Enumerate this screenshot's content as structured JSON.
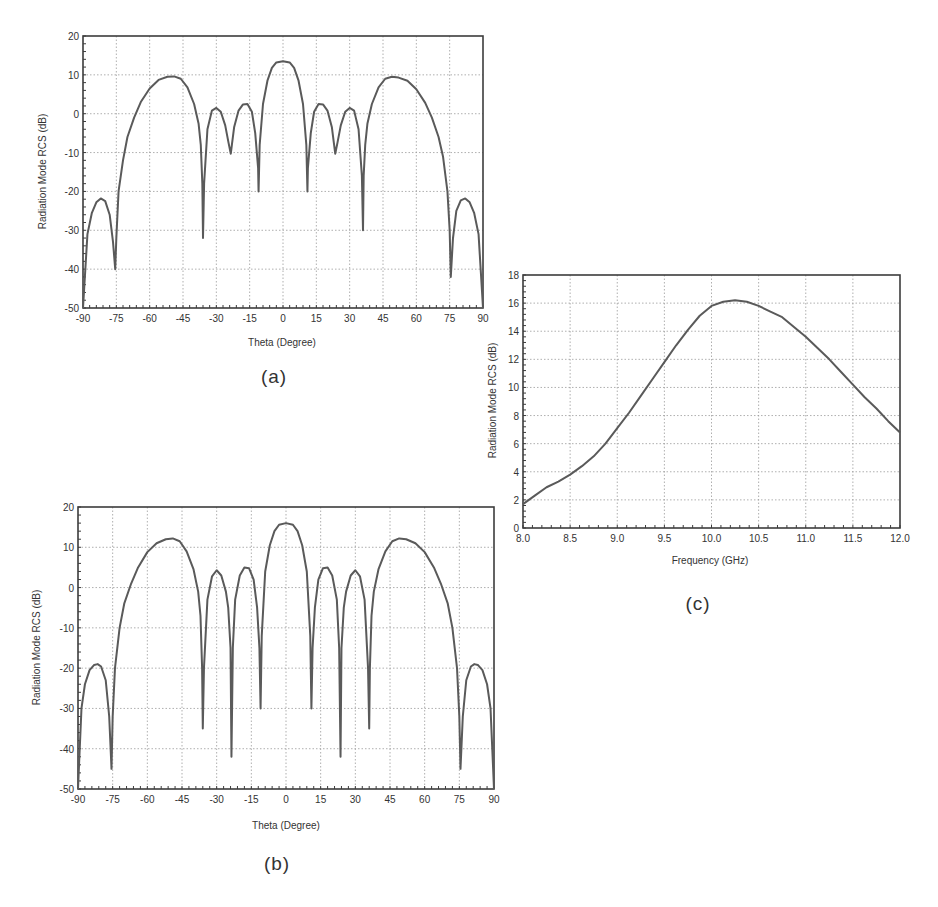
{
  "chart_data": [
    {
      "id": "a",
      "type": "line",
      "caption": "(a)",
      "title": "",
      "xlabel": "Theta (Degree)",
      "ylabel": "Radiation Mode RCS (dB)",
      "xlim": [
        -90,
        90
      ],
      "ylim": [
        -50,
        20
      ],
      "xticks": [
        -90,
        -75,
        -60,
        -45,
        -30,
        -15,
        0,
        15,
        30,
        45,
        60,
        75,
        90
      ],
      "yticks": [
        -50,
        -40,
        -30,
        -20,
        -10,
        0,
        10,
        20
      ],
      "grid": true,
      "legend": null,
      "series": [
        {
          "name": "Radiation mode RCS",
          "x": [
            -90,
            -88,
            -86,
            -84,
            -82,
            -80,
            -78,
            -76.5,
            -75.5,
            -75,
            -74,
            -72,
            -70,
            -67,
            -64,
            -60,
            -56,
            -52,
            -49,
            -46,
            -43,
            -40,
            -38,
            -37,
            -36.3,
            -36,
            -35.5,
            -34,
            -32,
            -30,
            -28,
            -26,
            -24.5,
            -23.5,
            -23,
            -22,
            -20,
            -18,
            -16,
            -14,
            -12.5,
            -11.2,
            -11,
            -10.5,
            -9,
            -7,
            -5,
            -3,
            0,
            3,
            5,
            7,
            9,
            10.5,
            11,
            11.2,
            12.5,
            14,
            16,
            18,
            20,
            22,
            23,
            23.5,
            24.5,
            26,
            28,
            30,
            32,
            34,
            35.5,
            36,
            36.3,
            37,
            38,
            40,
            43,
            46,
            49,
            52,
            56,
            60,
            64,
            67,
            70,
            72,
            74,
            75,
            75.5,
            76.5,
            78,
            80,
            82,
            84,
            86,
            88,
            90
          ],
          "y": [
            -50,
            -31,
            -25.5,
            -22.8,
            -21.8,
            -22.5,
            -26,
            -33,
            -40,
            -32,
            -20,
            -12,
            -6,
            -1,
            3,
            6.5,
            8.7,
            9.5,
            9.6,
            9,
            6.8,
            2.5,
            -2.5,
            -8,
            -18,
            -32,
            -18,
            -4,
            0.8,
            1.5,
            0.5,
            -3,
            -7.5,
            -10.3,
            -8,
            -3.5,
            0.8,
            2.4,
            2.5,
            0.5,
            -5,
            -14,
            -20,
            -8,
            2.5,
            8.5,
            11.8,
            13.2,
            13.5,
            13.2,
            11.8,
            8.5,
            2.5,
            -8,
            -20,
            -14,
            -5,
            0.5,
            2.5,
            2.4,
            0.8,
            -3.5,
            -8,
            -10.3,
            -7.5,
            -3,
            0.5,
            1.5,
            0.8,
            -4,
            -16,
            -30,
            -16,
            -8,
            -2.5,
            2.5,
            6.8,
            9,
            9.5,
            9.3,
            8.5,
            6.3,
            2.8,
            -1,
            -6,
            -11,
            -20,
            -30,
            -42,
            -32,
            -25,
            -22.3,
            -21.8,
            -22.8,
            -25.5,
            -31,
            -50
          ]
        }
      ]
    },
    {
      "id": "b",
      "type": "line",
      "caption": "(b)",
      "title": "",
      "xlabel": "Theta (Degree)",
      "ylabel": "Radiation Mode RCS (dB)",
      "xlim": [
        -90,
        90
      ],
      "ylim": [
        -50,
        20
      ],
      "xticks": [
        -90,
        -75,
        -60,
        -45,
        -30,
        -15,
        0,
        15,
        30,
        45,
        60,
        75,
        90
      ],
      "yticks": [
        -50,
        -40,
        -30,
        -20,
        -10,
        0,
        10,
        20
      ],
      "grid": true,
      "legend": null,
      "series": [
        {
          "name": "Radiation mode RCS",
          "x": [
            -90,
            -88.5,
            -87,
            -85,
            -83,
            -81.5,
            -80,
            -78,
            -76.5,
            -75.5,
            -75,
            -74,
            -72,
            -70,
            -67,
            -64,
            -60,
            -56,
            -52,
            -49,
            -46,
            -43,
            -40,
            -38,
            -37,
            -36.3,
            -36,
            -35.5,
            -34,
            -32,
            -30,
            -28,
            -26,
            -25,
            -24,
            -23.6,
            -23,
            -22,
            -20,
            -18,
            -16,
            -14,
            -12.5,
            -11.5,
            -11,
            -10.5,
            -9,
            -7,
            -5,
            -3,
            0,
            3,
            5,
            7,
            9,
            10.5,
            11,
            11.5,
            12.5,
            14,
            16,
            18,
            20,
            22,
            23,
            23.6,
            24,
            25,
            26,
            28,
            30,
            32,
            34,
            35.5,
            36,
            36.3,
            37,
            38,
            40,
            43,
            46,
            49,
            52,
            56,
            60,
            64,
            67,
            70,
            72,
            74,
            75,
            75.5,
            76.5,
            78,
            80,
            81.5,
            83,
            85,
            87,
            88.5,
            90
          ],
          "y": [
            -50,
            -30,
            -24,
            -20.5,
            -19.2,
            -19,
            -19.6,
            -23,
            -32,
            -45,
            -32,
            -20,
            -10,
            -4,
            1,
            5,
            8.8,
            11,
            12,
            12.2,
            11.5,
            9,
            4.5,
            -1,
            -7,
            -20,
            -35,
            -20,
            -3,
            2.8,
            4.3,
            3,
            -1,
            -5,
            -15,
            -42,
            -15,
            -3,
            3,
            5,
            4.8,
            2,
            -5,
            -15,
            -30,
            -12,
            4,
            10.5,
            14,
            15.6,
            16,
            15.6,
            14,
            10.5,
            4,
            -12,
            -30,
            -15,
            -5,
            2,
            4.8,
            5,
            3,
            -3,
            -15,
            -42,
            -15,
            -5,
            -1,
            3,
            4.3,
            2.8,
            -3,
            -20,
            -35,
            -20,
            -7,
            -1,
            4.5,
            9,
            11.5,
            12.2,
            12,
            11,
            8.8,
            5,
            1,
            -4,
            -10,
            -20,
            -32,
            -45,
            -32,
            -23,
            -19.6,
            -19,
            -19.2,
            -20.5,
            -24,
            -30,
            -50
          ]
        }
      ]
    },
    {
      "id": "c",
      "type": "line",
      "caption": "(c)",
      "title": "",
      "xlabel": "Frequency (GHz)",
      "ylabel": "Radiation Mode RCS (dB)",
      "xlim": [
        8.0,
        12.0
      ],
      "ylim": [
        0,
        18
      ],
      "xticks": [
        "8.0",
        "8.5",
        "9.0",
        "9.5",
        "10.0",
        "10.5",
        "11.0",
        "11.5",
        "12.0"
      ],
      "yticks": [
        0,
        2,
        4,
        6,
        8,
        10,
        12,
        14,
        16,
        18
      ],
      "grid": true,
      "legend": null,
      "series": [
        {
          "name": "Radiation mode RCS",
          "x": [
            8.0,
            8.125,
            8.25,
            8.375,
            8.5,
            8.625,
            8.75,
            8.875,
            9.0,
            9.125,
            9.25,
            9.375,
            9.5,
            9.625,
            9.75,
            9.875,
            10.0,
            10.125,
            10.25,
            10.375,
            10.5,
            10.625,
            10.75,
            10.875,
            11.0,
            11.125,
            11.25,
            11.375,
            11.5,
            11.625,
            11.75,
            11.875,
            12.0
          ],
          "y": [
            1.7,
            2.3,
            2.9,
            3.3,
            3.8,
            4.4,
            5.1,
            6.0,
            7.1,
            8.2,
            9.4,
            10.6,
            11.8,
            13.0,
            14.1,
            15.1,
            15.8,
            16.1,
            16.2,
            16.1,
            15.8,
            15.4,
            15.0,
            14.3,
            13.6,
            12.8,
            12.0,
            11.1,
            10.2,
            9.3,
            8.5,
            7.6,
            6.8
          ]
        }
      ]
    }
  ],
  "colors": {
    "curve": "#5a5a5a",
    "frame": "#3c3c3c",
    "grid": "#9a9a9a",
    "text": "#333333",
    "background": "#ffffff"
  }
}
